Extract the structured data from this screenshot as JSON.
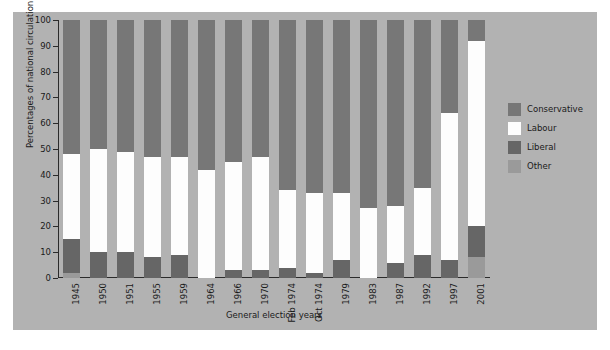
{
  "chart_data": {
    "type": "bar",
    "title": "",
    "subtitle": "",
    "xlabel": "General election years",
    "ylabel": "Percentages of national circulation",
    "ylim": [
      0,
      100
    ],
    "yticks": [
      0,
      10,
      20,
      30,
      40,
      50,
      60,
      70,
      80,
      90,
      100
    ],
    "grid": false,
    "stacked": true,
    "stack_order_bottom_to_top": [
      "Other",
      "Liberal",
      "Labour",
      "Conservative"
    ],
    "legend_position": "right",
    "categories": [
      "1945",
      "1950",
      "1951",
      "1955",
      "1959",
      "1964",
      "1966",
      "1970",
      "Feb 1974",
      "Oct 1974",
      "1979",
      "1983",
      "1987",
      "1992",
      "1997",
      "2001"
    ],
    "series": [
      {
        "name": "Other",
        "color": "#9a9a9a",
        "values": [
          2,
          0,
          0,
          0,
          0,
          0,
          0,
          0,
          0,
          0,
          0,
          0,
          0,
          0,
          0,
          8
        ]
      },
      {
        "name": "Liberal",
        "color": "#666666",
        "values": [
          13,
          10,
          10,
          8,
          9,
          0,
          3,
          3,
          4,
          2,
          7,
          0,
          6,
          9,
          7,
          12
        ]
      },
      {
        "name": "Labour",
        "color": "#fdfdfd",
        "values": [
          33,
          40,
          39,
          39,
          38,
          42,
          42,
          44,
          30,
          31,
          26,
          27,
          22,
          26,
          57,
          72
        ]
      },
      {
        "name": "Conservative",
        "color": "#777777",
        "values": [
          52,
          50,
          51,
          53,
          53,
          58,
          55,
          53,
          66,
          67,
          67,
          73,
          72,
          65,
          36,
          8
        ]
      }
    ],
    "bar_tops_cumulative": {
      "1945": {
        "other": 2,
        "liberal": 15,
        "labour": 48,
        "conservative": 100
      },
      "1950": {
        "other": 0,
        "liberal": 10,
        "labour": 50,
        "conservative": 100
      },
      "1951": {
        "other": 0,
        "liberal": 10,
        "labour": 49,
        "conservative": 100
      },
      "1955": {
        "other": 0,
        "liberal": 8,
        "labour": 47,
        "conservative": 100
      },
      "1959": {
        "other": 0,
        "liberal": 9,
        "labour": 47,
        "conservative": 100
      },
      "1964": {
        "other": 0,
        "liberal": 0,
        "labour": 42,
        "conservative": 100
      },
      "1966": {
        "other": 0,
        "liberal": 3,
        "labour": 45,
        "conservative": 100
      },
      "1970": {
        "other": 0,
        "liberal": 3,
        "labour": 47,
        "conservative": 100
      },
      "Feb 1974": {
        "other": 0,
        "liberal": 4,
        "labour": 34,
        "conservative": 100
      },
      "Oct 1974": {
        "other": 0,
        "liberal": 2,
        "labour": 33,
        "conservative": 100
      },
      "1979": {
        "other": 0,
        "liberal": 7,
        "labour": 33,
        "conservative": 100
      },
      "1983": {
        "other": 0,
        "liberal": 0,
        "labour": 27,
        "conservative": 100
      },
      "1987": {
        "other": 0,
        "liberal": 6,
        "labour": 28,
        "conservative": 100
      },
      "1992": {
        "other": 0,
        "liberal": 9,
        "labour": 35,
        "conservative": 100
      },
      "1997": {
        "other": 0,
        "liberal": 7,
        "labour": 64,
        "conservative": 100
      },
      "2001": {
        "other": 8,
        "liberal": 20,
        "labour": 92,
        "conservative": 100
      }
    }
  },
  "legend": {
    "items": [
      {
        "label": "Conservative",
        "color": "#777777"
      },
      {
        "label": "Labour",
        "color": "#fdfdfd"
      },
      {
        "label": "Liberal",
        "color": "#666666"
      },
      {
        "label": "Other",
        "color": "#9a9a9a"
      }
    ]
  },
  "theme": {
    "panel_background": "#b2b2b2",
    "figure_background": "#ffffff",
    "axis_color": "#2b2b2b",
    "text_color": "#1a1a1a"
  }
}
